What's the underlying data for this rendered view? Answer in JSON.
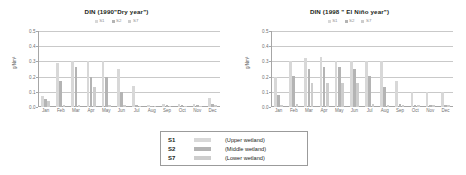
{
  "figure": {
    "series_names": [
      "S1",
      "S2",
      "S7"
    ],
    "series_colors": [
      "#d8d8d8",
      "#b4b4b4",
      "#cdcdcd"
    ],
    "axis_color": "#a6a6a6",
    "grid_color": "#c9c9c9"
  },
  "legend_box": {
    "rows": [
      {
        "key": "S1",
        "description": "(Upper wetland)",
        "color": "#d8d8d8"
      },
      {
        "key": "S2",
        "description": "(Middle wetland)",
        "color": "#b4b4b4"
      },
      {
        "key": "S7",
        "description": "(Lower wetland)",
        "color": "#cdcdcd"
      }
    ]
  },
  "chart_data": [
    {
      "type": "bar",
      "title": "DIN  (1990\"Dry year\")",
      "xlabel": "",
      "ylabel": "g/Nm³",
      "ylim": [
        0.0,
        0.5
      ],
      "yticks": [
        "0.5",
        "0.4",
        "0.3",
        "0.2",
        "0.1",
        "0.0"
      ],
      "ytick_values": [
        0.5,
        0.4,
        0.3,
        0.2,
        0.1,
        0.0
      ],
      "grid": true,
      "legend_position": "above-plot",
      "categories": [
        "Jan",
        "Feb",
        "Mar",
        "Apr",
        "May",
        "Jun",
        "Jul",
        "Aug",
        "Sep",
        "Oct",
        "Nov",
        "Dec"
      ],
      "series": [
        {
          "name": "S1",
          "values": [
            0.07,
            0.29,
            0.3,
            0.3,
            0.3,
            0.25,
            0.14,
            0.015,
            0.02,
            0.02,
            0.02,
            0.06
          ]
        },
        {
          "name": "S2",
          "values": [
            0.05,
            0.17,
            0.26,
            0.2,
            0.2,
            0.1,
            0.01,
            0.008,
            0.012,
            0.012,
            0.012,
            0.02
          ]
        },
        {
          "name": "S7",
          "values": [
            0.04,
            0.015,
            0.015,
            0.13,
            0.015,
            0.012,
            0.008,
            0.006,
            0.008,
            0.008,
            0.008,
            0.012
          ]
        }
      ]
    },
    {
      "type": "bar",
      "title": "DIN  (1998 \" El Niño year\")",
      "xlabel": "",
      "ylabel": "g/Nm³",
      "ylim": [
        0.0,
        0.5
      ],
      "yticks": [
        "0.5",
        "0.4",
        "0.3",
        "0.2",
        "0.1",
        "0.0"
      ],
      "ytick_values": [
        0.5,
        0.4,
        0.3,
        0.2,
        0.1,
        0.0
      ],
      "grid": true,
      "legend_position": "above-plot",
      "categories": [
        "Jan",
        "Feb",
        "Mar",
        "Apr",
        "May",
        "Jun",
        "Jul",
        "Aug",
        "Sep",
        "Oct",
        "Nov",
        "Dec"
      ],
      "series": [
        {
          "name": "S1",
          "values": [
            0.2,
            0.3,
            0.32,
            0.33,
            0.3,
            0.3,
            0.3,
            0.3,
            0.17,
            0.1,
            0.1,
            0.1
          ]
        },
        {
          "name": "S2",
          "values": [
            0.08,
            0.205,
            0.25,
            0.26,
            0.26,
            0.25,
            0.205,
            0.13,
            0.02,
            0.012,
            0.012,
            0.012
          ]
        },
        {
          "name": "S7",
          "values": [
            0.015,
            0.02,
            0.155,
            0.16,
            0.155,
            0.155,
            0.02,
            0.015,
            0.012,
            0.01,
            0.01,
            0.012
          ]
        }
      ]
    }
  ]
}
